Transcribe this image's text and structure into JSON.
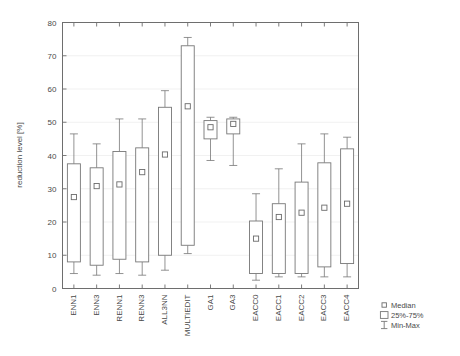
{
  "chart_data": {
    "type": "box",
    "title": "",
    "xlabel": "",
    "ylabel": "reduction level [%]",
    "ylim": [
      0,
      80
    ],
    "yticks": [
      0,
      10,
      20,
      30,
      40,
      50,
      60,
      70,
      80
    ],
    "ytick_labels": [
      "0",
      "10",
      "20",
      "30",
      "40",
      "50",
      "60",
      "70",
      "80"
    ],
    "grid": true,
    "grid_axis": "y",
    "legend_position": "bottom-right",
    "legend": [
      {
        "key": "median",
        "label": "Median",
        "marker": "small-open-square"
      },
      {
        "key": "quartiles",
        "label": "25%-75%",
        "marker": "open-rectangle"
      },
      {
        "key": "minmax",
        "label": "Min-Max",
        "marker": "capped-vertical-line"
      }
    ],
    "categories": [
      "ENN1",
      "ENN3",
      "RENN1",
      "RENN3",
      "ALL3NN",
      "MULTIEDIT",
      "GA1",
      "GA3",
      "EACC0",
      "EACC1",
      "EACC2",
      "EACC3",
      "EACC4"
    ],
    "boxes": [
      {
        "category": "ENN1",
        "min": 4.5,
        "q1": 8.0,
        "median": 27.5,
        "q3": 37.5,
        "max": 46.5
      },
      {
        "category": "ENN3",
        "min": 4.0,
        "q1": 7.0,
        "median": 30.8,
        "q3": 36.3,
        "max": 43.5
      },
      {
        "category": "RENN1",
        "min": 4.5,
        "q1": 8.8,
        "median": 31.3,
        "q3": 41.2,
        "max": 51.0
      },
      {
        "category": "RENN3",
        "min": 4.0,
        "q1": 8.0,
        "median": 35.0,
        "q3": 42.3,
        "max": 51.0
      },
      {
        "category": "ALL3NN",
        "min": 5.5,
        "q1": 10.0,
        "median": 40.3,
        "q3": 54.5,
        "max": 59.5
      },
      {
        "category": "MULTIEDIT",
        "min": 10.5,
        "q1": 13.0,
        "median": 54.8,
        "q3": 73.0,
        "max": 75.5
      },
      {
        "category": "GA1",
        "min": 38.5,
        "q1": 45.0,
        "median": 48.5,
        "q3": 50.5,
        "max": 51.5
      },
      {
        "category": "GA3",
        "min": 37.0,
        "q1": 46.5,
        "median": 49.5,
        "q3": 51.0,
        "max": 51.5
      },
      {
        "category": "EACC0",
        "min": 2.5,
        "q1": 4.5,
        "median": 15.0,
        "q3": 20.3,
        "max": 28.5
      },
      {
        "category": "EACC1",
        "min": 3.5,
        "q1": 4.5,
        "median": 21.5,
        "q3": 25.5,
        "max": 36.0
      },
      {
        "category": "EACC2",
        "min": 3.5,
        "q1": 4.5,
        "median": 22.8,
        "q3": 32.0,
        "max": 43.5
      },
      {
        "category": "EACC3",
        "min": 3.5,
        "q1": 6.5,
        "median": 24.3,
        "q3": 37.8,
        "max": 46.5
      },
      {
        "category": "EACC4",
        "min": 3.5,
        "q1": 7.5,
        "median": 25.5,
        "q3": 42.0,
        "max": 45.5
      }
    ],
    "colors": {
      "frame": "#6e6e6e",
      "grid": "#ededed",
      "box_stroke": "#777777",
      "box_fill": "#ffffff",
      "whisker": "#777777",
      "median": "#6b6b6b",
      "text": "#4a4a4a",
      "background": "#ffffff"
    }
  }
}
